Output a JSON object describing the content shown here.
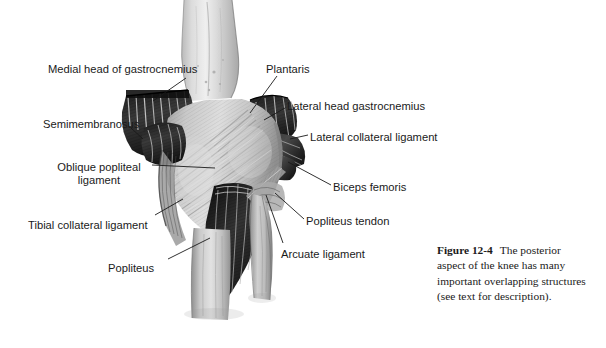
{
  "figure": {
    "title": "Posterior aspect of the knee",
    "background_color": "#ffffff",
    "ink_color": "#1a1a1a"
  },
  "labels": [
    {
      "id": "medial-head-of-gastrocnemius",
      "text": "Medial head of gastrocnemius",
      "lines": [
        "Medial head of gastrocnemius"
      ],
      "x": 48,
      "y": 63,
      "align": "left"
    },
    {
      "id": "plantaris",
      "text": "Plantaris",
      "lines": [
        "Plantaris"
      ],
      "x": 266,
      "y": 63,
      "align": "left"
    },
    {
      "id": "lateral-head-gastrocnemius",
      "text": "Lateral head gastrocnemius",
      "lines": [
        "Lateral head gastrocnemius"
      ],
      "x": 287,
      "y": 100,
      "align": "left"
    },
    {
      "id": "semimembranosus",
      "text": "Semimembranosus",
      "lines": [
        "Semimembranosus"
      ],
      "x": 43,
      "y": 118,
      "align": "left"
    },
    {
      "id": "lateral-collateral-ligament",
      "text": "Lateral collateral ligament",
      "lines": [
        "Lateral collateral ligament"
      ],
      "x": 310,
      "y": 131,
      "align": "left"
    },
    {
      "id": "oblique-popliteal-ligament",
      "text": "Oblique popliteal ligament",
      "lines": [
        "Oblique popliteal",
        "ligament"
      ],
      "x": 44,
      "y": 161,
      "align": "center",
      "width": 110
    },
    {
      "id": "biceps-femoris",
      "text": "Biceps femoris",
      "lines": [
        "Biceps femoris"
      ],
      "x": 333,
      "y": 181,
      "align": "left"
    },
    {
      "id": "tibial-collateral-ligament",
      "text": "Tibial collateral ligament",
      "lines": [
        "Tibial collateral ligament"
      ],
      "x": 28,
      "y": 219,
      "align": "left"
    },
    {
      "id": "popliteus-tendon",
      "text": "Popliteus tendon",
      "lines": [
        "Popliteus tendon"
      ],
      "x": 306,
      "y": 215,
      "align": "left"
    },
    {
      "id": "arcuate-ligament",
      "text": "Arcuate ligament",
      "lines": [
        "Arcuate ligament"
      ],
      "x": 281,
      "y": 248,
      "align": "left"
    },
    {
      "id": "popliteus",
      "text": "Popliteus",
      "lines": [
        "Popliteus"
      ],
      "x": 108,
      "y": 262,
      "align": "left"
    }
  ],
  "leader_lines": [
    {
      "id": "leader-medial-head-of-gastrocnemius",
      "points": "186,78 153,101"
    },
    {
      "id": "leader-plantaris",
      "points": "277,76 250,113"
    },
    {
      "id": "leader-lateral-head-gastrocnemius",
      "points": "285,108 264,120"
    },
    {
      "id": "leader-semimembranosus",
      "points": "131,128 143,139"
    },
    {
      "id": "leader-lateral-collateral-ligament",
      "points": "308,135 290,139"
    },
    {
      "id": "leader-oblique-popliteal-ligament",
      "points": "152,165 215,168"
    },
    {
      "id": "leader-biceps-femoris",
      "points": "331,185 288,162"
    },
    {
      "id": "leader-tibial-collateral-ligament",
      "points": "155,215 183,199"
    },
    {
      "id": "leader-popliteus-tendon",
      "points": "304,219 275,193"
    },
    {
      "id": "leader-arcuate-ligament",
      "points": "283,243 266,195"
    },
    {
      "id": "leader-popliteus",
      "points": "168,259 210,238"
    }
  ],
  "caption": {
    "figure_number": "Figure 12-4",
    "body": "The posterior aspect of the knee has many important overlapping structures (see text for description)."
  }
}
